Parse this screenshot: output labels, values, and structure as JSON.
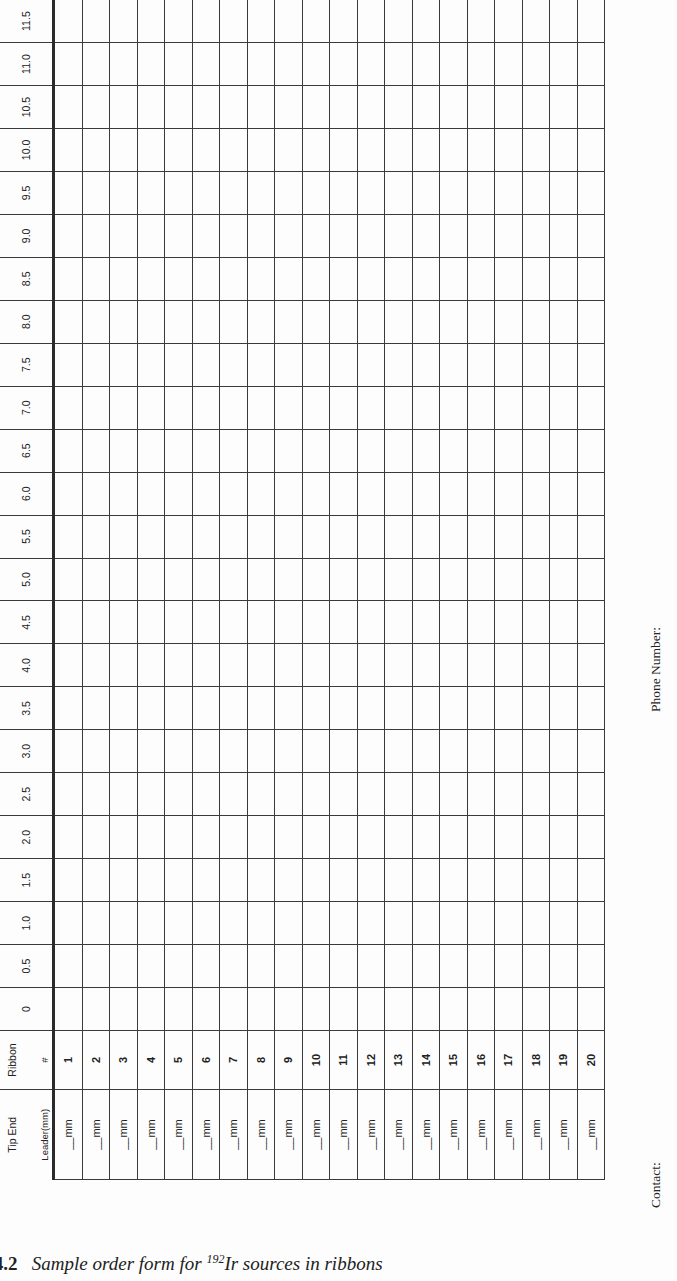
{
  "form": {
    "header": {
      "tip_end": "Tip End",
      "leader": "Leader(mm)",
      "ribbon": "Ribbon",
      "ribbon_hash": "#",
      "positions": [
        "0",
        "0.5",
        "1.0",
        "1.5",
        "2.0",
        "2.5",
        "3.0",
        "3.5",
        "4.0",
        "4.5",
        "5.0",
        "5.5",
        "6.0",
        "6.5",
        "7.0",
        "7.5",
        "8.0",
        "8.5",
        "9.0",
        "9.5",
        "10.0",
        "10.5",
        "11.0",
        "11.5"
      ]
    },
    "rows": [
      {
        "leader": "__mm",
        "ribbon": "1"
      },
      {
        "leader": "__mm",
        "ribbon": "2"
      },
      {
        "leader": "__mm",
        "ribbon": "3"
      },
      {
        "leader": "__mm",
        "ribbon": "4"
      },
      {
        "leader": "__mm",
        "ribbon": "5"
      },
      {
        "leader": "__mm",
        "ribbon": "6"
      },
      {
        "leader": "__mm",
        "ribbon": "7"
      },
      {
        "leader": "__mm",
        "ribbon": "8"
      },
      {
        "leader": "__mm",
        "ribbon": "9"
      },
      {
        "leader": "__mm",
        "ribbon": "10"
      },
      {
        "leader": "__mm",
        "ribbon": "11"
      },
      {
        "leader": "__mm",
        "ribbon": "12"
      },
      {
        "leader": "__mm",
        "ribbon": "13"
      },
      {
        "leader": "__mm",
        "ribbon": "14"
      },
      {
        "leader": "__mm",
        "ribbon": "15"
      },
      {
        "leader": "__mm",
        "ribbon": "16"
      },
      {
        "leader": "__mm",
        "ribbon": "17"
      },
      {
        "leader": "__mm",
        "ribbon": "18"
      },
      {
        "leader": "__mm",
        "ribbon": "19"
      },
      {
        "leader": "__mm",
        "ribbon": "20"
      }
    ],
    "phone_label": "Phone Number:",
    "contact_label": "Contact:"
  },
  "caption": {
    "prefix": "ure 4.2",
    "text_before": "Sample order form for ",
    "isotope_mass": "192",
    "text_after": "Ir sources in ribbons"
  }
}
